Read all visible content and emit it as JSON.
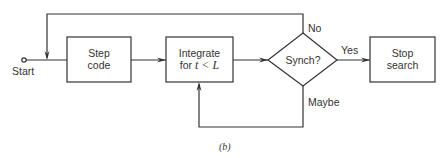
{
  "diagram": {
    "caption": "(b)",
    "start_label": "Start",
    "nodes": [
      {
        "id": "step-code",
        "shape": "rect",
        "line1": "Step",
        "line2": "code"
      },
      {
        "id": "integrate",
        "shape": "rect",
        "line1": "Integrate",
        "line2_prefix": "for ",
        "line2_math": "t < L"
      },
      {
        "id": "synch",
        "shape": "diamond",
        "label": "Synch?"
      },
      {
        "id": "stop-search",
        "shape": "rect",
        "line1": "Stop",
        "line2": "search"
      }
    ],
    "edges": [
      {
        "from": "start",
        "to": "step-code"
      },
      {
        "from": "step-code",
        "to": "integrate"
      },
      {
        "from": "integrate",
        "to": "synch"
      },
      {
        "from": "synch",
        "to": "stop-search",
        "label": "Yes"
      },
      {
        "from": "synch",
        "to": "step-code",
        "label": "No"
      },
      {
        "from": "synch",
        "to": "integrate",
        "label": "Maybe"
      }
    ],
    "edge_labels": {
      "yes": "Yes",
      "no": "No",
      "maybe": "Maybe"
    },
    "line_color": "#333333"
  }
}
